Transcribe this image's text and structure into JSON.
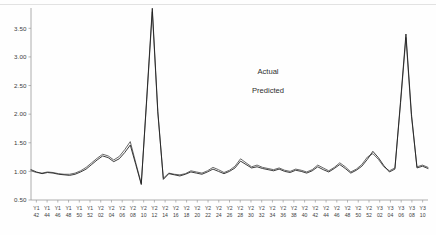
{
  "chart_data": {
    "type": "line",
    "title": "",
    "subtitle": "",
    "xlabel": "",
    "ylabel": "",
    "ylim": [
      0.5,
      3.75
    ],
    "yticks": [
      0.5,
      1.0,
      1.5,
      2.0,
      2.5,
      3.0,
      3.5
    ],
    "ytick_labels": [
      "0.50",
      "1.00",
      "1.50",
      "2.00",
      "2.50",
      "3.00",
      "3.50"
    ],
    "grid": false,
    "legend_position": "upper-center-right",
    "legend": [
      "Actual",
      "Predicted"
    ],
    "categories": [
      "Y1 42",
      "Y1 44",
      "Y1 46",
      "Y1 48",
      "Y1 50",
      "Y1 52",
      "Y2 02",
      "Y2 04",
      "Y2 06",
      "Y2 08",
      "Y2 10",
      "Y2 12",
      "Y2 14",
      "Y2 16",
      "Y2 18",
      "Y2 20",
      "Y2 22",
      "Y2 24",
      "Y2 26",
      "Y2 28",
      "Y2 30",
      "Y2 32",
      "Y2 34",
      "Y2 36",
      "Y2 38",
      "Y2 40",
      "Y2 42",
      "Y2 44",
      "Y2 46",
      "Y2 48",
      "Y2 50",
      "Y2 52",
      "Y3 02",
      "Y3 04",
      "Y3 06",
      "Y3 08",
      "Y3 10"
    ],
    "xtick_top_labels": [
      "Y1",
      "Y1",
      "Y1",
      "Y1",
      "Y1",
      "Y1",
      "Y2",
      "Y2",
      "Y2",
      "Y2",
      "Y2",
      "Y2",
      "Y2",
      "Y2",
      "Y2",
      "Y2",
      "Y2",
      "Y2",
      "Y2",
      "Y2",
      "Y2",
      "Y2",
      "Y2",
      "Y2",
      "Y2",
      "Y2",
      "Y2",
      "Y2",
      "Y2",
      "Y2",
      "Y2",
      "Y2",
      "Y3",
      "Y3",
      "Y3",
      "Y3",
      "Y3"
    ],
    "xtick_bottom_labels": [
      "42",
      "44",
      "46",
      "48",
      "50",
      "52",
      "02",
      "04",
      "06",
      "08",
      "10",
      "12",
      "14",
      "16",
      "18",
      "20",
      "22",
      "24",
      "26",
      "28",
      "30",
      "32",
      "34",
      "36",
      "38",
      "40",
      "42",
      "44",
      "46",
      "48",
      "50",
      "52",
      "02",
      "04",
      "06",
      "08",
      "10"
    ],
    "series": [
      {
        "name": "Actual",
        "color": "#1b1b1b",
        "values": [
          1.02,
          0.96,
          0.99,
          0.95,
          0.93,
          0.97,
          1.1,
          1.22,
          1.18,
          1.46,
          0.78,
          3.85,
          0.96,
          0.93,
          0.97,
          1.0,
          1.02,
          0.97,
          1.06,
          1.17,
          1.09,
          1.05,
          1.04,
          1.0,
          1.03,
          0.99,
          1.07,
          1.0,
          0.96,
          1.06,
          1.12,
          1.34,
          1.02,
          1.08,
          1.06,
          1.0,
          0.99
        ]
      },
      {
        "name": "Predicted",
        "color": "#4e4e4e",
        "values": [
          1.0,
          0.97,
          0.98,
          0.96,
          0.95,
          0.99,
          1.12,
          1.26,
          1.2,
          1.52,
          0.8,
          3.8,
          0.97,
          0.94,
          0.98,
          1.02,
          1.04,
          0.99,
          1.08,
          1.2,
          1.07,
          1.03,
          1.05,
          1.02,
          1.01,
          1.0,
          1.09,
          1.02,
          0.98,
          1.04,
          1.14,
          1.3,
          1.04,
          1.1,
          1.04,
          1.02,
          1.01
        ]
      }
    ],
    "dense_x": [
      0,
      1,
      2,
      3,
      4,
      5,
      6,
      7,
      8,
      9,
      10,
      11,
      12,
      13,
      14,
      15,
      16,
      17,
      18,
      19,
      20,
      21,
      22,
      23,
      24,
      25,
      26,
      27,
      28,
      29,
      30,
      31,
      32,
      33,
      34,
      35,
      36,
      37,
      38,
      39,
      40,
      41,
      42,
      43,
      44,
      45,
      46,
      47,
      48,
      49,
      50,
      51,
      52,
      53,
      54,
      55,
      56,
      57,
      58,
      59,
      60,
      61,
      62,
      63,
      64,
      65,
      66,
      67,
      68,
      69,
      70,
      71,
      72
    ],
    "dense_actual": [
      1.03,
      0.99,
      0.96,
      0.98,
      0.97,
      0.95,
      0.94,
      0.93,
      0.95,
      0.99,
      1.04,
      1.12,
      1.2,
      1.27,
      1.24,
      1.17,
      1.22,
      1.33,
      1.46,
      1.12,
      0.77,
      2.3,
      3.85,
      2.05,
      0.86,
      0.96,
      0.94,
      0.92,
      0.95,
      0.99,
      0.97,
      0.95,
      0.99,
      1.04,
      1.0,
      0.96,
      1.0,
      1.06,
      1.18,
      1.12,
      1.06,
      1.08,
      1.05,
      1.03,
      1.01,
      1.04,
      1.0,
      0.98,
      1.02,
      1.0,
      0.97,
      1.01,
      1.08,
      1.03,
      0.99,
      1.05,
      1.12,
      1.05,
      0.97,
      1.02,
      1.09,
      1.21,
      1.35,
      1.24,
      1.1,
      0.99,
      1.04,
      2.2,
      3.4,
      2.0,
      1.06,
      1.09,
      1.05
    ],
    "dense_pred": [
      1.01,
      0.98,
      0.97,
      0.99,
      0.98,
      0.96,
      0.95,
      0.95,
      0.97,
      1.01,
      1.07,
      1.15,
      1.23,
      1.3,
      1.27,
      1.2,
      1.26,
      1.38,
      1.52,
      1.15,
      0.79,
      2.26,
      3.79,
      2.02,
      0.88,
      0.97,
      0.95,
      0.94,
      0.96,
      1.01,
      0.99,
      0.97,
      1.01,
      1.07,
      1.03,
      0.98,
      1.02,
      1.09,
      1.22,
      1.15,
      1.08,
      1.11,
      1.07,
      1.05,
      1.03,
      1.06,
      1.02,
      1.0,
      1.04,
      1.02,
      0.99,
      1.03,
      1.11,
      1.06,
      1.01,
      1.07,
      1.15,
      1.08,
      0.99,
      1.04,
      1.12,
      1.25,
      1.31,
      1.21,
      1.08,
      1.01,
      1.06,
      2.16,
      3.34,
      1.96,
      1.08,
      1.11,
      1.07
    ]
  }
}
